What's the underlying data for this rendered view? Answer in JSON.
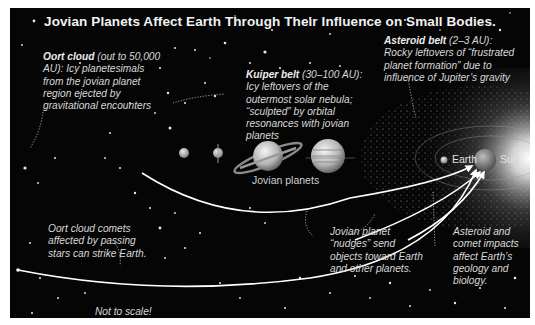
{
  "title": "Jovian Planets Affect Earth Through Their Influence on Small Bodies.",
  "annotations": {
    "oort_cloud": {
      "heading": "Oort cloud",
      "text": " (out to 50,000 AU): Icy planetesimals from the jovian planet region ejected by gravitational encounters"
    },
    "kuiper_belt": {
      "heading": "Kuiper belt",
      "text": " (30–100 AU): Icy leftovers of the outermost solar nebula; “sculpted” by orbital resonances with jovian planets"
    },
    "asteroid_belt": {
      "heading": "Asteroid belt",
      "text": " (2–3 AU): Rocky leftovers of “frustrated planet formation” due to influence of Jupiter’s gravity"
    },
    "oort_comets": "Oort cloud comets affected by passing stars can strike Earth.",
    "jovian_nudges": "Jovian planet “nudges” send objects toward Earth and other planets.",
    "impacts": "Asteroid and comet impacts affect Earth’s geology and biology.",
    "scale_note": "Not to scale!"
  },
  "labels": {
    "jovian_planets": "Jovian planets",
    "earth": "Earth",
    "sun": "Sun"
  },
  "bodies": [
    "Neptune",
    "Uranus",
    "Saturn",
    "Jupiter",
    "Mars",
    "Earth",
    "Sun"
  ],
  "colors": {
    "background": "#050505",
    "text": "#d8d8d8",
    "arrow": "#ffffff",
    "frame": "#ffffff"
  }
}
